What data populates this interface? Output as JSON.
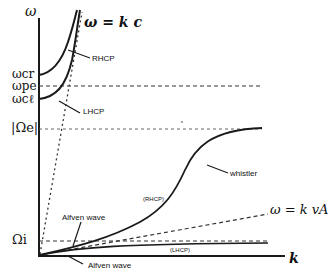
{
  "diagram": {
    "axes": {
      "y_label": "ω",
      "x_label": "k"
    },
    "y_ticks": [
      {
        "id": "wcr",
        "label": "ωcr"
      },
      {
        "id": "wpe",
        "label": "ωpe"
      },
      {
        "id": "wcl",
        "label": "ωcℓ"
      },
      {
        "id": "Oe",
        "label": "|Ωe|"
      },
      {
        "id": "Oi",
        "label": "Ωi"
      }
    ],
    "asymptotes": [
      {
        "id": "light",
        "label": "ω = k c"
      },
      {
        "id": "alfven",
        "label": "ω = k vA"
      }
    ],
    "curve_labels": {
      "rhcp": "RHCP",
      "lhcp": "LHCP",
      "whistler": "whistler",
      "rhcp_paren": "(RHCP)",
      "lhcp_paren": "(LHCP)",
      "alfven_upper": "Alfven wave",
      "alfven_lower": "Alfven wave"
    },
    "colors": {
      "ink": "#1a1a1a",
      "dash": "#333333",
      "background": "#ffffff"
    }
  }
}
